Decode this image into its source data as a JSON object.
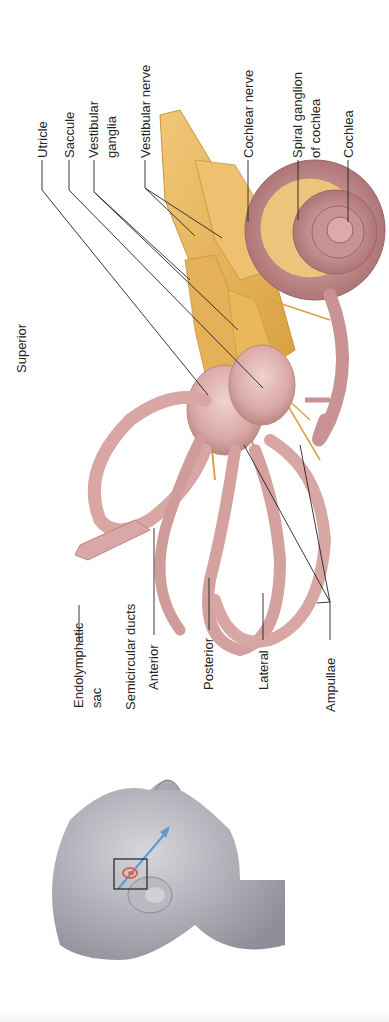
{
  "figure": {
    "orientation_label": "Superior",
    "labels": {
      "utricle": "Utricle",
      "saccule": "Saccule",
      "vestibular_ganglia_1": "Vestibular",
      "vestibular_ganglia_2": "ganglia",
      "vestibular_nerve": "Vestibular nerve",
      "cochlear_nerve": "Cochlear nerve",
      "spiral_ganglion_1": "Spiral ganglion",
      "spiral_ganglion_2": "of cochlea",
      "cochlea": "Cochlea",
      "endolymphatic_1": "Endolymphatic",
      "endolymphatic_2": "sac",
      "semicircular_ducts": "Semicircular ducts",
      "anterior": "Anterior",
      "posterior": "Posterior",
      "lateral": "Lateral",
      "ampullae": "Ampullae"
    },
    "colors": {
      "membrane": "#d9a8a6",
      "membrane_dark": "#b98683",
      "nerve": "#e8b85a",
      "nerve_dark": "#c9953a",
      "head": "#9c9ca4",
      "arrow": "#5b9bd1",
      "locator": "#e0604a",
      "leader": "#222222"
    }
  }
}
